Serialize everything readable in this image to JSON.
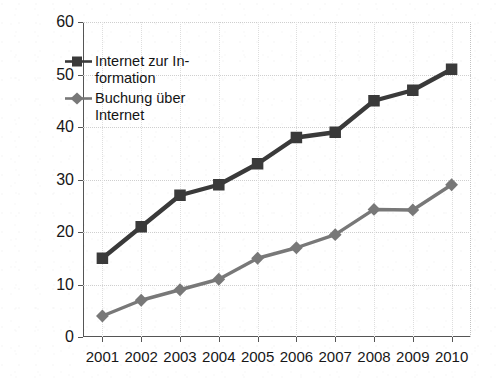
{
  "chart_data": {
    "type": "line",
    "title": "",
    "subtitle": "",
    "xlabel": "",
    "ylabel": "Nutzer in % der Bevölkerung +14",
    "categories": [
      "2001",
      "2002",
      "2003",
      "2004",
      "2005",
      "2006",
      "2007",
      "2008",
      "2009",
      "2010"
    ],
    "x": [
      2001,
      2002,
      2003,
      2004,
      2005,
      2006,
      2007,
      2008,
      2009,
      2010
    ],
    "ylim": [
      0,
      60
    ],
    "ytick_step": 10,
    "yticks": [
      "0",
      "10",
      "20",
      "30",
      "40",
      "50",
      "60"
    ],
    "grid": true,
    "legend_position": "inside-upper-left",
    "series": [
      {
        "name": "Internet zur In-\nformation",
        "name_line1": "Internet zur In-",
        "name_line2": "formation",
        "marker": "square",
        "color": "#3a3a3a",
        "values": [
          15,
          21,
          27,
          29,
          33,
          38,
          39,
          45,
          47,
          51
        ]
      },
      {
        "name": "Buchung über\nInternet",
        "name_line1": "Buchung über",
        "name_line2": "Internet",
        "marker": "diamond",
        "color": "#787878",
        "values": [
          4,
          7,
          9,
          11,
          15,
          17,
          19.5,
          24.3,
          24.2,
          29
        ]
      }
    ]
  },
  "colors": {
    "series_information": "#3a3a3a",
    "series_buchung": "#787878",
    "axis": "#555555",
    "gridline": "#cfcfcf",
    "text": "#171717",
    "background": "#ffffff"
  }
}
